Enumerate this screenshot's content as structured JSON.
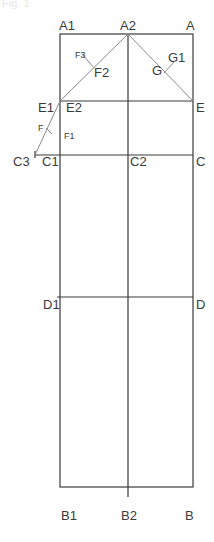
{
  "caption": "Fig. 1",
  "colors": {
    "frame": "#3a3a3a",
    "diagonal": "#8a8a8a",
    "label": "#3a3a3a",
    "background": "#ffffff"
  },
  "labels": {
    "A1": "A1",
    "A2": "A2",
    "A": "A",
    "F3": "F3",
    "F2": "F2",
    "G": "G",
    "G1": "G1",
    "E1": "E1",
    "E2": "E2",
    "E": "E",
    "F": "F",
    "F1": "F1",
    "C3": "C3",
    "C1": "C1",
    "C2": "C2",
    "C": "C",
    "D1": "D1",
    "D": "D",
    "B1": "B1",
    "B2": "B2",
    "B": "B"
  }
}
